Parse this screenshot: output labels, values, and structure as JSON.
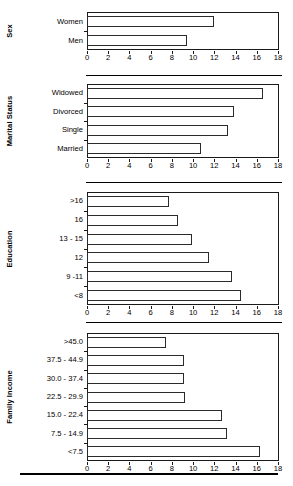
{
  "chart_data": {
    "type": "bar",
    "orientation": "horizontal",
    "title": "",
    "xlabel": "",
    "ylabel": "",
    "xlim": [
      0,
      18
    ],
    "xticks": [
      0,
      2,
      4,
      6,
      8,
      10,
      12,
      14,
      16,
      18
    ],
    "xtick_labels": [
      "0",
      "2",
      "4",
      "6",
      "8",
      "10",
      "12",
      "14",
      "16",
      "18"
    ],
    "grid": false,
    "legend": null,
    "bar_facecolor": "#ffffff",
    "bar_edgecolor": "#2b2b2b",
    "axes_color": "#1a1a1a",
    "panels": [
      {
        "group_label": "Sex",
        "categories": [
          "Women",
          "Men"
        ],
        "values": [
          12.0,
          9.4
        ]
      },
      {
        "group_label": "Marital Status",
        "categories": [
          "Widowed",
          "Divorced",
          "Single",
          "Married"
        ],
        "values": [
          16.6,
          13.9,
          13.3,
          10.7
        ]
      },
      {
        "group_label": "Education",
        "categories": [
          ">16",
          "16",
          "13 - 15",
          "12",
          "9 -11",
          "<8"
        ],
        "values": [
          7.7,
          8.6,
          9.9,
          11.5,
          13.7,
          14.5
        ]
      },
      {
        "group_label": "Family Income",
        "categories": [
          ">45.0",
          "37.5 - 44.9",
          "30.0 - 37.4",
          "22.5 - 29.9",
          "15.0 - 22.4",
          "7.5 - 14.9",
          "<7.5"
        ],
        "values": [
          7.4,
          9.1,
          9.1,
          9.2,
          12.7,
          13.2,
          16.3
        ]
      }
    ]
  }
}
